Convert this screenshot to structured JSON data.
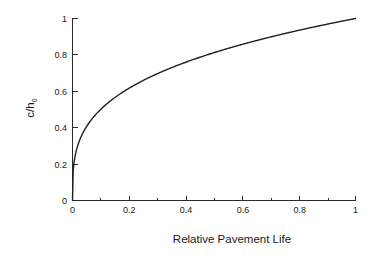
{
  "chart_data": {
    "type": "line",
    "title": "",
    "xlabel": "Relative Pavement Life",
    "ylabel": "c/h0",
    "ylabel_parts": {
      "main": "c/h",
      "subscript": "0"
    },
    "xlim": [
      0,
      1
    ],
    "ylim": [
      0,
      1
    ],
    "xticks": [
      0,
      0.2,
      0.4,
      0.6,
      0.8,
      1
    ],
    "xtick_labels": [
      "0",
      "0.2",
      "0.4",
      "0.6",
      "0.8",
      "1"
    ],
    "yticks": [
      0,
      0.2,
      0.4,
      0.6,
      0.8,
      1
    ],
    "ytick_labels": [
      "0",
      "0.2",
      "0.4",
      "0.6",
      "0.8",
      "1"
    ],
    "grid": false,
    "legend": null,
    "legend_position": "none",
    "minor_xticks": [
      0.1,
      0.3,
      0.5,
      0.7,
      0.9
    ],
    "series": [
      {
        "name": "Crack depth ratio",
        "color": "#1f1f1f",
        "relation": "c/h0 = (Relative Pavement Life)^0.30",
        "x": [
          0,
          0.002,
          0.005,
          0.01,
          0.02,
          0.03,
          0.05,
          0.07,
          0.1,
          0.13,
          0.16,
          0.2,
          0.25,
          0.3,
          0.35,
          0.4,
          0.45,
          0.5,
          0.55,
          0.6,
          0.65,
          0.7,
          0.75,
          0.8,
          0.85,
          0.9,
          0.95,
          1
        ],
        "y": [
          0,
          0.168,
          0.223,
          0.275,
          0.338,
          0.382,
          0.442,
          0.487,
          0.543,
          0.587,
          0.623,
          0.664,
          0.709,
          0.747,
          0.779,
          0.808,
          0.833,
          0.857,
          0.879,
          0.899,
          0.918,
          0.936,
          0.952,
          0.968,
          0.983,
          0.997,
          1.011,
          1.0
        ]
      }
    ]
  },
  "axes": {
    "x_axis_name": "x-axis",
    "y_axis_name": "y-axis"
  }
}
